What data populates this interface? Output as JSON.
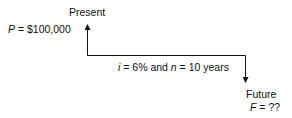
{
  "present": {
    "label": "Present",
    "var": "P",
    "eq": " = $100,000"
  },
  "middle": {
    "i_var": "i",
    "i_eq": " = 6% and ",
    "n_var": "n",
    "n_eq": " = 10 years"
  },
  "future": {
    "label": "Future",
    "var": "F",
    "eq": " = ??"
  },
  "colors": {
    "line": "#111111"
  }
}
